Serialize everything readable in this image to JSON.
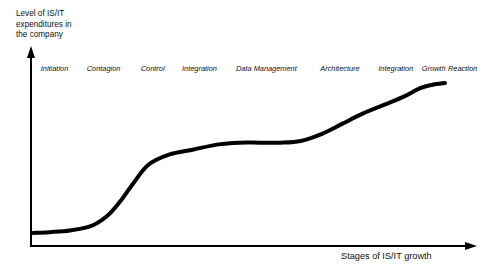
{
  "figure": {
    "y_axis_label": "Level of IS/IT\nexpenditures in\nthe company",
    "x_axis_label": "Stages of IS/IT growth"
  },
  "chart_data": {
    "type": "line",
    "title": "",
    "xlabel": "Stages of IS/IT growth",
    "ylabel": "Level of IS/IT expenditures in the company",
    "grid": false,
    "legend": "none",
    "axis_arrows": true,
    "categories": [
      "Initiation",
      "Contagion",
      "Control",
      "Integration",
      "Data Management",
      "Architecture",
      "Integration",
      "Growth",
      "Reaction"
    ],
    "series": [
      {
        "name": "IS/IT expenditure growth curve",
        "shape": "s-curve",
        "x": [
          0,
          4,
          9,
          14,
          18,
          21,
          24,
          28,
          33,
          39,
          45,
          50,
          55,
          60,
          65,
          70,
          75,
          80,
          85,
          90,
          94,
          97,
          100
        ],
        "values": [
          4,
          4.5,
          5.5,
          8,
          14,
          22,
          32,
          44,
          50,
          53,
          56,
          57,
          57,
          57,
          58,
          62,
          68,
          74,
          79,
          84,
          89,
          91,
          92
        ]
      }
    ],
    "xlim": [
      0,
      100
    ],
    "ylim": [
      0,
      100
    ],
    "line_color": "#000000",
    "line_width_px": 4,
    "stage_label_positions_pct": [
      5.5,
      16.5,
      27.5,
      38.0,
      53.0,
      69.5,
      82.0,
      90.5,
      97.0
    ]
  },
  "axes": {
    "x_color": "#000000",
    "y_color": "#000000"
  }
}
